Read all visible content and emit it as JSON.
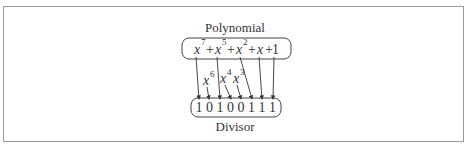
{
  "diagram": {
    "top_label": "Polynomial",
    "bottom_label": "Divisor",
    "polynomial": {
      "variable": "x",
      "terms": [
        {
          "base": "x",
          "exp": "7"
        },
        {
          "op": "+"
        },
        {
          "base": "x",
          "exp": "5"
        },
        {
          "op": "+"
        },
        {
          "base": "x",
          "exp": "2"
        },
        {
          "op": "+"
        },
        {
          "base": "x",
          "exp": ""
        },
        {
          "op": "+"
        },
        {
          "base": "1",
          "exp": ""
        }
      ]
    },
    "missing_terms": [
      {
        "base": "x",
        "exp": "6"
      },
      {
        "base": "x",
        "exp": "4"
      },
      {
        "base": "x",
        "exp": "3"
      }
    ],
    "divisor_bits": [
      "1",
      "0",
      "1",
      "0",
      "0",
      "1",
      "1",
      "1"
    ]
  }
}
